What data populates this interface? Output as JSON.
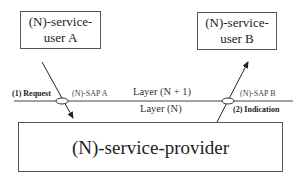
{
  "diagram": {
    "service_user_a": {
      "line1": "(N)-service-",
      "line2": "user A"
    },
    "service_user_b": {
      "line1": "(N)-service-",
      "line2": "user B"
    },
    "service_provider": {
      "label": "(N)-service-provider"
    },
    "sap_a": "(N)-SAP  A",
    "sap_b": "(N)-SAP  B",
    "layer_upper": "Layer (N + 1)",
    "layer_lower": "Layer (N)",
    "request": "(1) Request",
    "indication": "(2) Indication",
    "colors": {
      "line": "#333333",
      "box_border": "#555555",
      "background": "#ffffff"
    }
  }
}
